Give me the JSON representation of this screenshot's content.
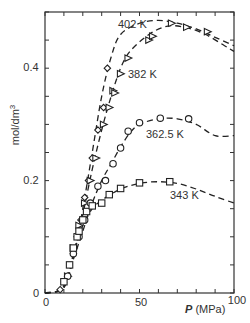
{
  "chart_data": {
    "type": "scatter",
    "title": "",
    "xlabel": "P (MPa)",
    "xlabel_italic_part": "P",
    "xlabel_unit": "(MPa)",
    "ylabel": "mol/dm3",
    "xlim": [
      0,
      100
    ],
    "ylim": [
      0,
      0.5
    ],
    "xticks_labeled": [
      0,
      50,
      100
    ],
    "xticks_minor_step": 10,
    "yticks_labeled": [
      0,
      0.2,
      0.4
    ],
    "yticks_labels": [
      "0",
      "0.2",
      "0.4"
    ],
    "yticks_minor_step": 0.05,
    "grid": false,
    "legend": "inline curve labels",
    "series": [
      {
        "name": "402 K",
        "marker": "diamond",
        "fit_line": "dashed",
        "points": [
          [
            8,
            0.006
          ],
          [
            12,
            0.03
          ],
          [
            15,
            0.07
          ],
          [
            17,
            0.1
          ],
          [
            19,
            0.13
          ],
          [
            21,
            0.17
          ],
          [
            23,
            0.2
          ],
          [
            25,
            0.24
          ],
          [
            28,
            0.29
          ],
          [
            31,
            0.33
          ],
          [
            33,
            0.4
          ]
        ],
        "curve": [
          [
            0,
            0
          ],
          [
            8,
            0.005
          ],
          [
            12,
            0.025
          ],
          [
            16,
            0.08
          ],
          [
            20,
            0.15
          ],
          [
            25,
            0.25
          ],
          [
            30,
            0.35
          ],
          [
            35,
            0.42
          ],
          [
            40,
            0.46
          ],
          [
            50,
            0.48
          ],
          [
            60,
            0.485
          ],
          [
            70,
            0.48
          ],
          [
            80,
            0.47
          ],
          [
            90,
            0.455
          ],
          [
            100,
            0.44
          ]
        ]
      },
      {
        "name": "382 K",
        "marker": "triangle-right",
        "fit_line": "dashed",
        "points": [
          [
            12,
            0.03
          ],
          [
            15,
            0.08
          ],
          [
            18,
            0.12
          ],
          [
            21,
            0.16
          ],
          [
            24,
            0.2
          ],
          [
            27,
            0.24
          ],
          [
            31,
            0.3
          ],
          [
            34,
            0.33
          ],
          [
            36,
            0.36
          ],
          [
            37,
            0.356
          ],
          [
            40,
            0.39
          ],
          [
            44,
            0.418
          ],
          [
            55,
            0.45
          ],
          [
            57,
            0.457
          ],
          [
            67,
            0.48
          ],
          [
            75,
            0.473
          ],
          [
            86,
            0.465
          ]
        ],
        "curve": [
          [
            0,
            0
          ],
          [
            10,
            0.01
          ],
          [
            15,
            0.07
          ],
          [
            20,
            0.14
          ],
          [
            25,
            0.22
          ],
          [
            30,
            0.29
          ],
          [
            35,
            0.35
          ],
          [
            40,
            0.4
          ],
          [
            45,
            0.43
          ],
          [
            55,
            0.46
          ],
          [
            65,
            0.475
          ],
          [
            75,
            0.472
          ],
          [
            85,
            0.46
          ],
          [
            95,
            0.44
          ],
          [
            100,
            0.43
          ]
        ]
      },
      {
        "name": "362.5 K",
        "marker": "circle",
        "fit_line": "dashed",
        "points": [
          [
            12,
            0.03
          ],
          [
            15,
            0.07
          ],
          [
            18,
            0.1
          ],
          [
            21,
            0.13
          ],
          [
            24,
            0.16
          ],
          [
            28,
            0.19
          ],
          [
            32,
            0.2
          ],
          [
            36,
            0.23
          ],
          [
            40,
            0.258
          ],
          [
            44,
            0.288
          ],
          [
            50,
            0.303
          ],
          [
            61,
            0.311
          ],
          [
            76,
            0.31
          ]
        ],
        "curve": [
          [
            0,
            0
          ],
          [
            10,
            0.01
          ],
          [
            15,
            0.06
          ],
          [
            20,
            0.11
          ],
          [
            25,
            0.16
          ],
          [
            30,
            0.2
          ],
          [
            35,
            0.23
          ],
          [
            40,
            0.26
          ],
          [
            45,
            0.285
          ],
          [
            50,
            0.3
          ],
          [
            60,
            0.31
          ],
          [
            70,
            0.31
          ],
          [
            80,
            0.3
          ],
          [
            90,
            0.28
          ],
          [
            100,
            0.28
          ]
        ]
      },
      {
        "name": "343 K",
        "marker": "square",
        "fit_line": "dashed",
        "points": [
          [
            10,
            0.02
          ],
          [
            13,
            0.05
          ],
          [
            15,
            0.08
          ],
          [
            17,
            0.1
          ],
          [
            18,
            0.11
          ],
          [
            20,
            0.13
          ],
          [
            22,
            0.145
          ],
          [
            25,
            0.155
          ],
          [
            30,
            0.16
          ],
          [
            34,
            0.175
          ],
          [
            40,
            0.186
          ],
          [
            50,
            0.196
          ],
          [
            66,
            0.198
          ]
        ],
        "curve": [
          [
            0,
            0
          ],
          [
            8,
            0.005
          ],
          [
            12,
            0.03
          ],
          [
            16,
            0.08
          ],
          [
            20,
            0.12
          ],
          [
            25,
            0.15
          ],
          [
            30,
            0.165
          ],
          [
            40,
            0.185
          ],
          [
            50,
            0.195
          ],
          [
            60,
            0.198
          ],
          [
            70,
            0.195
          ],
          [
            80,
            0.185
          ],
          [
            90,
            0.172
          ],
          [
            100,
            0.16
          ]
        ]
      }
    ]
  },
  "labels": {
    "x_axis_var": "P",
    "x_axis_unit": " (MPa)",
    "y_axis": "mol/dm",
    "y_axis_sup": "3",
    "x_ticks": [
      "0",
      "50",
      "100"
    ],
    "y_ticks": [
      "0",
      "0.2",
      "0.4"
    ],
    "curve_402": "402 K",
    "curve_382": "382 K",
    "curve_362": "362.5 K",
    "curve_343": "343 K"
  },
  "colors": {
    "ink": "#222222",
    "background": "#ffffff"
  }
}
